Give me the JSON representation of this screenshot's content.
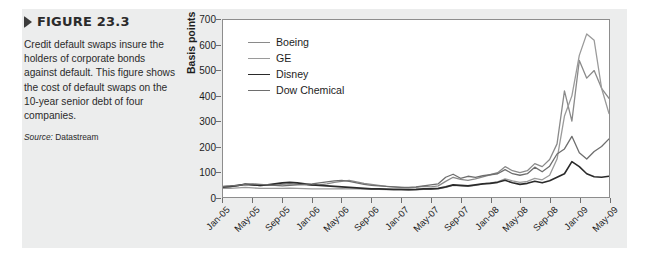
{
  "figure": {
    "marker_icon": "triangle-right-icon",
    "title": "FIGURE 23.3",
    "caption": "Credit default swaps insure the holders of corporate bonds against default. This figure shows the cost of default swaps on the 10-year senior debt of four companies.",
    "source_label": "Source:",
    "source_value": "Datastream"
  },
  "colors": {
    "panel_background": "#eceded",
    "page_background": "#ffffff",
    "plot_background": "#ffffff",
    "plot_border": "#8d8d8d",
    "text": "#1d1d1d",
    "boeing": "#8a8a8a",
    "ge": "#9a9a9a",
    "disney": "#2a2a2a",
    "dow_chemical": "#6e6e6e"
  },
  "chart_data": {
    "type": "line",
    "title": "",
    "xlabel": "",
    "ylabel": "Basis points",
    "ylim": [
      0,
      700
    ],
    "yticks": [
      0,
      100,
      200,
      300,
      400,
      500,
      600,
      700
    ],
    "grid": false,
    "legend_position": "top-left",
    "x_tick_labels": [
      "Jan-05",
      "May-05",
      "Sep-05",
      "Jan-06",
      "May-06",
      "Sep-06",
      "Jan-07",
      "May-07",
      "Sep-07",
      "Jan-08",
      "May-08",
      "Sep-08",
      "Jan-09",
      "May-09"
    ],
    "x_tick_step_months": 4,
    "x": [
      "Jan-05",
      "Feb-05",
      "Mar-05",
      "Apr-05",
      "May-05",
      "Jun-05",
      "Jul-05",
      "Aug-05",
      "Sep-05",
      "Oct-05",
      "Nov-05",
      "Dec-05",
      "Jan-06",
      "Feb-06",
      "Mar-06",
      "Apr-06",
      "May-06",
      "Jun-06",
      "Jul-06",
      "Aug-06",
      "Sep-06",
      "Oct-06",
      "Nov-06",
      "Dec-06",
      "Jan-07",
      "Feb-07",
      "Mar-07",
      "Apr-07",
      "May-07",
      "Jun-07",
      "Jul-07",
      "Aug-07",
      "Sep-07",
      "Oct-07",
      "Nov-07",
      "Dec-07",
      "Jan-08",
      "Feb-08",
      "Mar-08",
      "Apr-08",
      "May-08",
      "Jun-08",
      "Jul-08",
      "Aug-08",
      "Sep-08",
      "Oct-08",
      "Nov-08",
      "Dec-08",
      "Jan-09",
      "Feb-09",
      "Mar-09",
      "Apr-09",
      "May-09"
    ],
    "series": [
      {
        "name": "Boeing",
        "color": "#8a8a8a",
        "width": 1.3,
        "values": [
          38,
          40,
          44,
          52,
          48,
          45,
          47,
          46,
          50,
          52,
          50,
          48,
          46,
          48,
          52,
          58,
          62,
          66,
          60,
          54,
          50,
          46,
          42,
          40,
          38,
          36,
          38,
          42,
          40,
          44,
          62,
          78,
          70,
          66,
          72,
          80,
          88,
          96,
          120,
          104,
          96,
          104,
          132,
          120,
          148,
          210,
          420,
          300,
          540,
          470,
          500,
          430,
          390
        ]
      },
      {
        "name": "GE",
        "color": "#9a9a9a",
        "width": 1.3,
        "values": [
          34,
          34,
          36,
          38,
          36,
          34,
          34,
          34,
          34,
          35,
          34,
          33,
          32,
          32,
          32,
          32,
          33,
          32,
          32,
          31,
          30,
          30,
          29,
          28,
          28,
          27,
          28,
          30,
          30,
          32,
          38,
          46,
          44,
          42,
          46,
          52,
          56,
          60,
          72,
          64,
          58,
          62,
          74,
          68,
          86,
          150,
          320,
          400,
          560,
          645,
          620,
          430,
          330
        ]
      },
      {
        "name": "Disney",
        "color": "#2a2a2a",
        "width": 1.6,
        "values": [
          40,
          42,
          46,
          50,
          48,
          46,
          48,
          52,
          56,
          58,
          56,
          52,
          48,
          46,
          44,
          42,
          40,
          38,
          36,
          34,
          32,
          32,
          31,
          30,
          30,
          29,
          30,
          32,
          32,
          34,
          40,
          48,
          46,
          44,
          48,
          52,
          54,
          58,
          66,
          56,
          50,
          54,
          62,
          56,
          64,
          78,
          92,
          140,
          120,
          92,
          80,
          78,
          82
        ]
      },
      {
        "name": "Dow Chemical",
        "color": "#6e6e6e",
        "width": 1.3,
        "values": [
          42,
          44,
          46,
          50,
          52,
          50,
          48,
          46,
          44,
          46,
          48,
          50,
          52,
          56,
          60,
          64,
          66,
          62,
          56,
          50,
          46,
          44,
          42,
          40,
          38,
          38,
          40,
          44,
          48,
          52,
          78,
          90,
          74,
          82,
          78,
          84,
          88,
          92,
          108,
          92,
          86,
          92,
          118,
          100,
          122,
          170,
          190,
          240,
          175,
          150,
          180,
          200,
          230
        ]
      }
    ]
  }
}
